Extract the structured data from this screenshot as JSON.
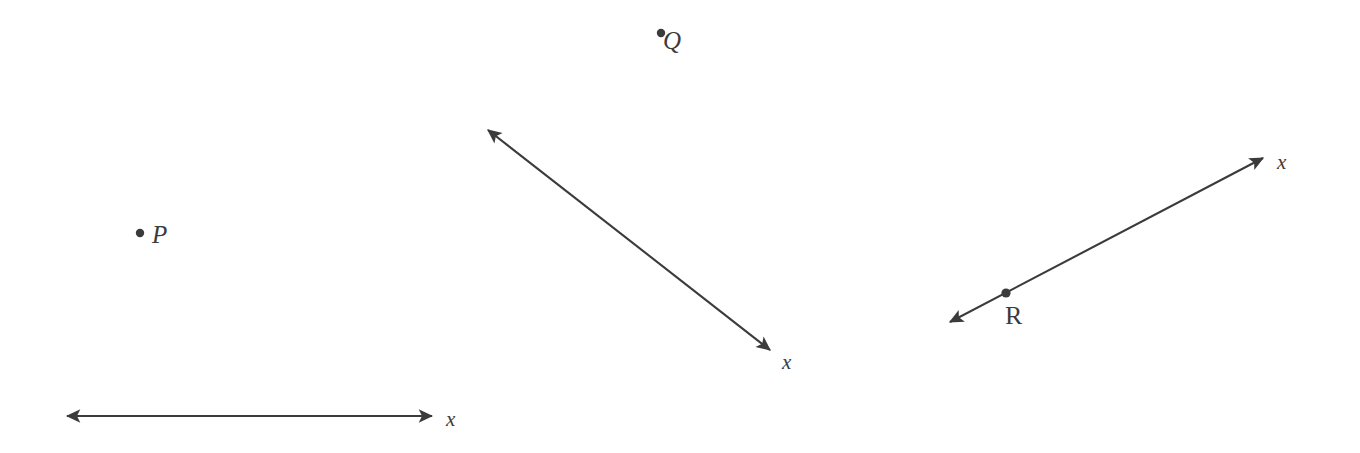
{
  "figure": {
    "background_color": "#ffffff",
    "ink_color": "#3b3b3b",
    "width": 1360,
    "height": 453
  },
  "points": [
    {
      "id": "P",
      "label": "P",
      "dot": {
        "cx": 140,
        "cy": 233,
        "r": 4.2
      },
      "label_pos": {
        "x": 152,
        "y": 222
      },
      "style": "italic",
      "on_line": false
    },
    {
      "id": "Q",
      "label": "Q",
      "dot": {
        "cx": 661,
        "cy": 33,
        "r": 4.2
      },
      "label_pos": {
        "x": 663,
        "y": 28
      },
      "style": "italic",
      "on_line": false
    },
    {
      "id": "R",
      "label": "R",
      "dot": {
        "cx": 1006,
        "cy": 293,
        "r": 4.6
      },
      "label_pos": {
        "x": 1005,
        "y": 303
      },
      "style": "upright",
      "on_line": true
    }
  ],
  "lines": [
    {
      "id": "line-bottom-left",
      "name": "horizontal-line",
      "label": "x",
      "label_pos": {
        "x": 446,
        "y": 409
      },
      "from": {
        "x": 67,
        "y": 416
      },
      "to": {
        "x": 432,
        "y": 416
      },
      "double_headed": true,
      "orientation": "horizontal",
      "angle_deg": 0
    },
    {
      "id": "line-middle",
      "name": "descending-diagonal-line",
      "label": "x",
      "label_pos": {
        "x": 782,
        "y": 352
      },
      "from": {
        "x": 488,
        "y": 130
      },
      "to": {
        "x": 770,
        "y": 350
      },
      "double_headed": true,
      "orientation": "diagonal-descending",
      "angle_deg": 38
    },
    {
      "id": "line-right",
      "name": "ascending-diagonal-line",
      "label": "x",
      "label_pos": {
        "x": 1277,
        "y": 152
      },
      "from": {
        "x": 950,
        "y": 322
      },
      "to": {
        "x": 1263,
        "y": 158
      },
      "double_headed": true,
      "orientation": "diagonal-ascending",
      "angle_deg": -27.6
    }
  ]
}
